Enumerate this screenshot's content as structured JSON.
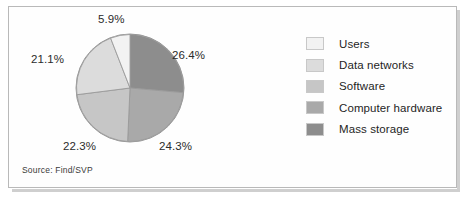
{
  "figure": {
    "source_note": "Source: Find/SVP",
    "frame_color": "#b9b9b9",
    "background": "#ffffff"
  },
  "legend": {
    "position": "right",
    "items": [
      {
        "label": "Users",
        "color": "#f2f2f2"
      },
      {
        "label": "Data networks",
        "color": "#dcdcdc"
      },
      {
        "label": "Software",
        "color": "#c6c6c6"
      },
      {
        "label": "Computer hardware",
        "color": "#a9a9a9"
      },
      {
        "label": "Mass storage",
        "color": "#8d8d8d"
      }
    ]
  },
  "labels": {
    "top": "5.9%",
    "right": "26.4%",
    "bottom_right": "24.3%",
    "bottom_left": "22.3%",
    "left": "21.1%"
  },
  "chart_data": {
    "type": "pie",
    "title": "",
    "subtitle": "",
    "xlabel": "",
    "ylabel": "",
    "grid": false,
    "legend_position": "right",
    "source": "Source: Find/SVP",
    "start_angle_deg": 0,
    "direction": "clockwise",
    "categories": [
      "Mass storage",
      "Computer hardware",
      "Software",
      "Data networks",
      "Users"
    ],
    "values": [
      26.4,
      24.3,
      22.3,
      21.1,
      5.9
    ],
    "value_labels": [
      "26.4%",
      "24.3%",
      "22.3%",
      "21.1%",
      "5.9%"
    ],
    "colors": [
      "#8d8d8d",
      "#a9a9a9",
      "#c6c6c6",
      "#dcdcdc",
      "#f2f2f2"
    ],
    "units": "percent",
    "total": 100.0,
    "slices": [
      {
        "name": "Mass storage",
        "value": 26.4,
        "label": "26.4%",
        "color": "#8d8d8d",
        "label_position": "right"
      },
      {
        "name": "Computer hardware",
        "value": 24.3,
        "label": "24.3%",
        "color": "#a9a9a9",
        "label_position": "bottom-right"
      },
      {
        "name": "Software",
        "value": 22.3,
        "label": "22.3%",
        "color": "#c6c6c6",
        "label_position": "bottom-left"
      },
      {
        "name": "Data networks",
        "value": 21.1,
        "label": "21.1%",
        "color": "#dcdcdc",
        "label_position": "left"
      },
      {
        "name": "Users",
        "value": 5.9,
        "label": "5.9%",
        "color": "#f2f2f2",
        "label_position": "top"
      }
    ]
  }
}
